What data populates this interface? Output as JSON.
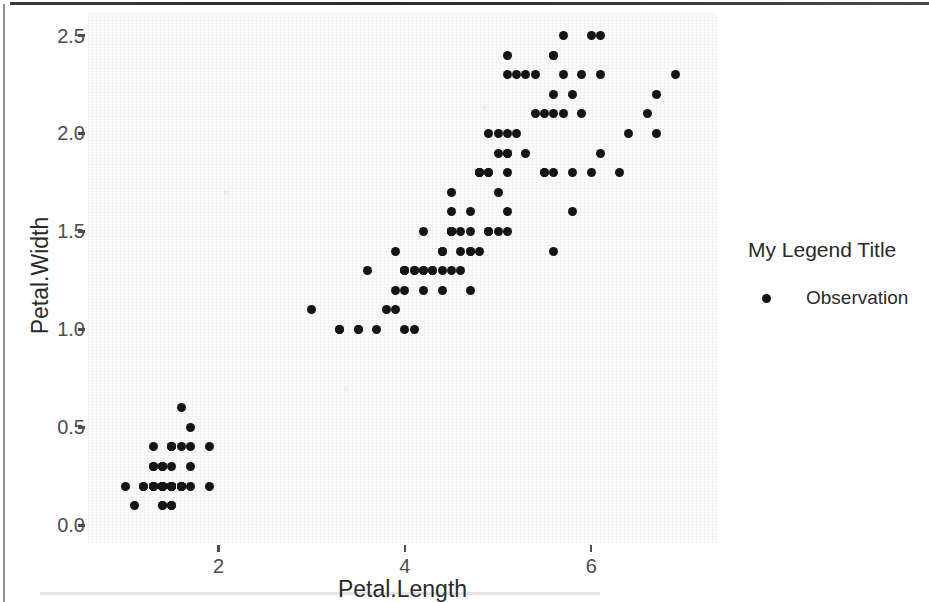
{
  "chart_data": {
    "type": "scatter",
    "title": "",
    "xlabel": "Petal.Length",
    "ylabel": "Petal.Width",
    "xlim": [
      0.6,
      7.35
    ],
    "ylim": [
      -0.09,
      2.62
    ],
    "xticks": [
      2,
      4,
      6
    ],
    "xtick_labels": [
      "2",
      "4",
      "6"
    ],
    "yticks": [
      0.0,
      0.5,
      1.0,
      1.5,
      2.0,
      2.5
    ],
    "ytick_labels": [
      "0.0",
      "0.5",
      "1.0",
      "1.5",
      "2.0",
      "2.5"
    ],
    "grid": false,
    "panel_background": "#fbfbfb",
    "point_color": "#141414",
    "point_count": 150,
    "legend": {
      "position": "right",
      "title": "My Legend Title",
      "entries": [
        {
          "label": "Observation",
          "marker": "circle",
          "color": "#141414"
        }
      ]
    },
    "series": [
      {
        "name": "Observation",
        "x": [
          1.4,
          1.4,
          1.3,
          1.5,
          1.4,
          1.7,
          1.4,
          1.5,
          1.4,
          1.5,
          1.5,
          1.6,
          1.4,
          1.1,
          1.2,
          1.5,
          1.3,
          1.4,
          1.7,
          1.5,
          1.7,
          1.5,
          1.0,
          1.7,
          1.9,
          1.6,
          1.6,
          1.5,
          1.4,
          1.6,
          1.6,
          1.5,
          1.5,
          1.4,
          1.5,
          1.2,
          1.3,
          1.4,
          1.3,
          1.5,
          1.3,
          1.3,
          1.3,
          1.6,
          1.9,
          1.4,
          1.6,
          1.4,
          1.5,
          1.4,
          4.7,
          4.5,
          4.9,
          4.0,
          4.6,
          4.5,
          4.7,
          3.3,
          4.6,
          3.9,
          3.5,
          4.2,
          4.0,
          4.7,
          3.6,
          4.4,
          4.5,
          4.1,
          4.5,
          3.9,
          4.8,
          4.0,
          4.9,
          4.7,
          4.3,
          4.4,
          4.8,
          5.0,
          4.5,
          3.5,
          3.8,
          3.7,
          3.9,
          5.1,
          4.5,
          4.5,
          4.7,
          4.4,
          4.1,
          4.0,
          4.4,
          4.6,
          4.0,
          3.3,
          4.2,
          4.2,
          4.2,
          4.3,
          3.0,
          4.1,
          6.0,
          5.1,
          5.9,
          5.6,
          5.8,
          6.6,
          4.5,
          6.3,
          5.8,
          6.1,
          5.1,
          5.3,
          5.5,
          5.0,
          5.1,
          5.3,
          5.5,
          6.7,
          6.9,
          5.0,
          5.7,
          4.9,
          6.7,
          4.9,
          5.7,
          6.0,
          4.8,
          4.9,
          5.6,
          5.8,
          6.1,
          6.4,
          5.6,
          5.1,
          5.6,
          6.1,
          5.6,
          5.5,
          4.8,
          5.4,
          5.6,
          5.1,
          5.1,
          5.9,
          5.7,
          5.2,
          5.0,
          5.2,
          5.4,
          5.1
        ],
        "y": [
          0.2,
          0.2,
          0.2,
          0.2,
          0.2,
          0.4,
          0.3,
          0.2,
          0.2,
          0.1,
          0.2,
          0.2,
          0.1,
          0.1,
          0.2,
          0.4,
          0.4,
          0.3,
          0.3,
          0.3,
          0.2,
          0.4,
          0.2,
          0.5,
          0.2,
          0.2,
          0.4,
          0.2,
          0.2,
          0.2,
          0.2,
          0.4,
          0.1,
          0.2,
          0.2,
          0.2,
          0.2,
          0.1,
          0.2,
          0.2,
          0.3,
          0.3,
          0.2,
          0.6,
          0.4,
          0.3,
          0.2,
          0.2,
          0.2,
          0.2,
          1.4,
          1.5,
          1.5,
          1.3,
          1.5,
          1.3,
          1.6,
          1.0,
          1.3,
          1.4,
          1.0,
          1.5,
          1.0,
          1.4,
          1.3,
          1.4,
          1.5,
          1.0,
          1.5,
          1.1,
          1.8,
          1.3,
          1.5,
          1.2,
          1.3,
          1.4,
          1.4,
          1.7,
          1.5,
          1.0,
          1.1,
          1.0,
          1.2,
          1.6,
          1.5,
          1.6,
          1.5,
          1.3,
          1.3,
          1.3,
          1.2,
          1.4,
          1.2,
          1.0,
          1.3,
          1.2,
          1.3,
          1.3,
          1.1,
          1.3,
          2.5,
          1.9,
          2.1,
          1.8,
          2.2,
          2.1,
          1.7,
          1.8,
          1.8,
          2.5,
          2.0,
          1.9,
          2.1,
          2.0,
          2.4,
          2.3,
          1.8,
          2.2,
          2.3,
          1.5,
          2.3,
          2.0,
          2.0,
          1.8,
          2.1,
          1.8,
          1.8,
          1.8,
          2.1,
          1.6,
          1.9,
          2.0,
          2.2,
          1.5,
          1.4,
          2.3,
          2.4,
          1.8,
          1.8,
          2.1,
          2.4,
          2.3,
          1.9,
          2.3,
          2.5,
          2.3,
          1.9,
          2.0,
          2.3,
          1.8
        ]
      }
    ]
  }
}
